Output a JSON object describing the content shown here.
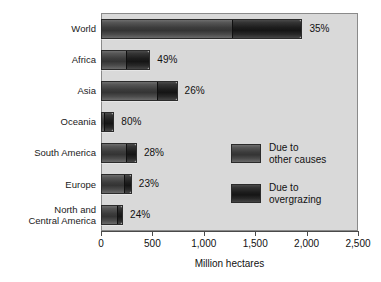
{
  "chart_data": {
    "type": "bar",
    "orientation": "horizontal",
    "stacked": true,
    "title": "",
    "xlabel": "Million hectares",
    "ylabel": "",
    "xlim": [
      0,
      2500
    ],
    "xticks": [
      0,
      500,
      1000,
      1500,
      2000,
      2500
    ],
    "xtick_labels": [
      "0",
      "500",
      "1,000",
      "1,500",
      "2,000",
      "2,500"
    ],
    "grid": false,
    "legend_position": "inside-right",
    "categories": [
      "World",
      "Africa",
      "Asia",
      "Oceania",
      "South America",
      "Europe",
      "North and\nCentral America"
    ],
    "series": [
      {
        "name": "Due to\nother causes",
        "color": "#3c3c3c",
        "values": [
          1274,
          245,
          551,
          26,
          252,
          231,
          163
        ]
      },
      {
        "name": "Due to\novergrazing",
        "color": "#1a1a1a",
        "values": [
          686,
          235,
          194,
          104,
          98,
          69,
          52
        ]
      }
    ],
    "totals": [
      1960,
      480,
      745,
      130,
      350,
      300,
      215
    ],
    "data_labels": [
      "35%",
      "49%",
      "26%",
      "80%",
      "28%",
      "23%",
      "24%"
    ],
    "data_label_meaning": "percent of degraded land due to overgrazing",
    "annotations": []
  },
  "axis": {
    "x_title": "Million hectares",
    "tick_labels": [
      "0",
      "500",
      "1,000",
      "1,500",
      "2,000",
      "2,500"
    ]
  },
  "y_categories": [
    {
      "label": "World",
      "lines": [
        "World"
      ]
    },
    {
      "label": "Africa",
      "lines": [
        "Africa"
      ]
    },
    {
      "label": "Asia",
      "lines": [
        "Asia"
      ]
    },
    {
      "label": "Oceania",
      "lines": [
        "Oceania"
      ]
    },
    {
      "label": "South America",
      "lines": [
        "South America"
      ]
    },
    {
      "label": "Europe",
      "lines": [
        "Europe"
      ]
    },
    {
      "label": "North and Central America",
      "lines": [
        "North and",
        "Central America"
      ]
    }
  ],
  "bars": [
    {
      "category": "World",
      "other": 1274,
      "over": 686,
      "total": 1960,
      "pct": "35%"
    },
    {
      "category": "Africa",
      "other": 245,
      "over": 235,
      "total": 480,
      "pct": "49%"
    },
    {
      "category": "Asia",
      "other": 551,
      "over": 194,
      "total": 745,
      "pct": "26%"
    },
    {
      "category": "Oceania",
      "other": 26,
      "over": 104,
      "total": 130,
      "pct": "80%"
    },
    {
      "category": "South America",
      "other": 252,
      "over": 98,
      "total": 350,
      "pct": "28%"
    },
    {
      "category": "Europe",
      "other": 231,
      "over": 69,
      "total": 300,
      "pct": "23%"
    },
    {
      "category": "North and Central America",
      "other": 163,
      "over": 52,
      "total": 215,
      "pct": "24%"
    }
  ],
  "legend": {
    "items": [
      {
        "label": "Due to\nother causes",
        "swatch": "other",
        "color": "#3c3c3c"
      },
      {
        "label": "Due to\novergrazing",
        "swatch": "over",
        "color": "#1a1a1a"
      }
    ]
  },
  "colors": {
    "plot_background": "#d9d9d9",
    "page_background": "#ffffff",
    "other_causes": "#3c3c3c",
    "overgrazing": "#1a1a1a",
    "axis": "#4a4a4a",
    "text": "#111111"
  }
}
